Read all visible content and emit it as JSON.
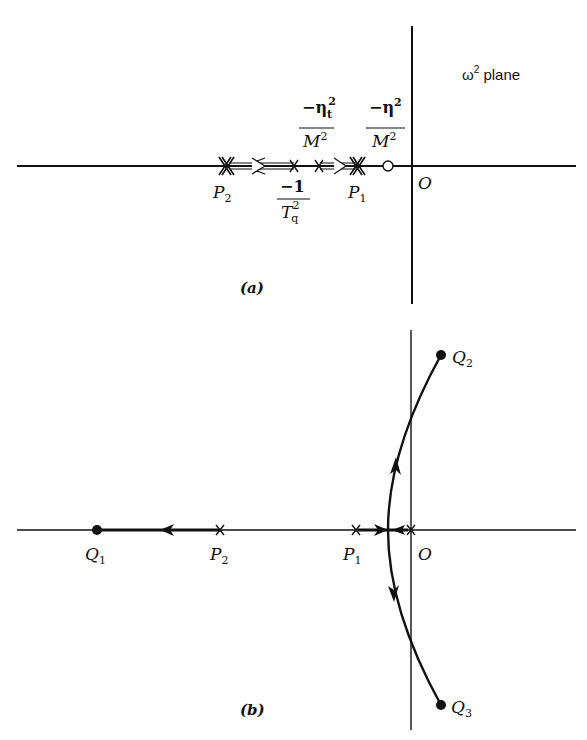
{
  "panel_a": {
    "plane_label": "ω",
    "plane_label_sup": "2",
    "plane_label_suffix": " plane",
    "origin_label": "O",
    "caption": "(a)",
    "p2": {
      "main": "P",
      "sub": "2"
    },
    "p1": {
      "main": "P",
      "sub": "1"
    },
    "tq": {
      "num": "−1",
      "den_main": "T",
      "den_sub": "q",
      "den_sup": "2"
    },
    "eta_t": {
      "num_main": "−η",
      "num_sub": "t",
      "num_sup": "2",
      "den_main": "M",
      "den_sup": "2"
    },
    "eta": {
      "num_main": "−η",
      "num_sup": "2",
      "den_main": "M",
      "den_sup": "2"
    }
  },
  "panel_b": {
    "origin_label": "O",
    "caption": "(b)",
    "q1": {
      "main": "Q",
      "sub": "1"
    },
    "q2": {
      "main": "Q",
      "sub": "2"
    },
    "q3": {
      "main": "Q",
      "sub": "3"
    },
    "p1": {
      "main": "P",
      "sub": "1"
    },
    "p2": {
      "main": "P",
      "sub": "2"
    }
  },
  "colors": {
    "ink": "#111111",
    "background": "#ffffff"
  }
}
